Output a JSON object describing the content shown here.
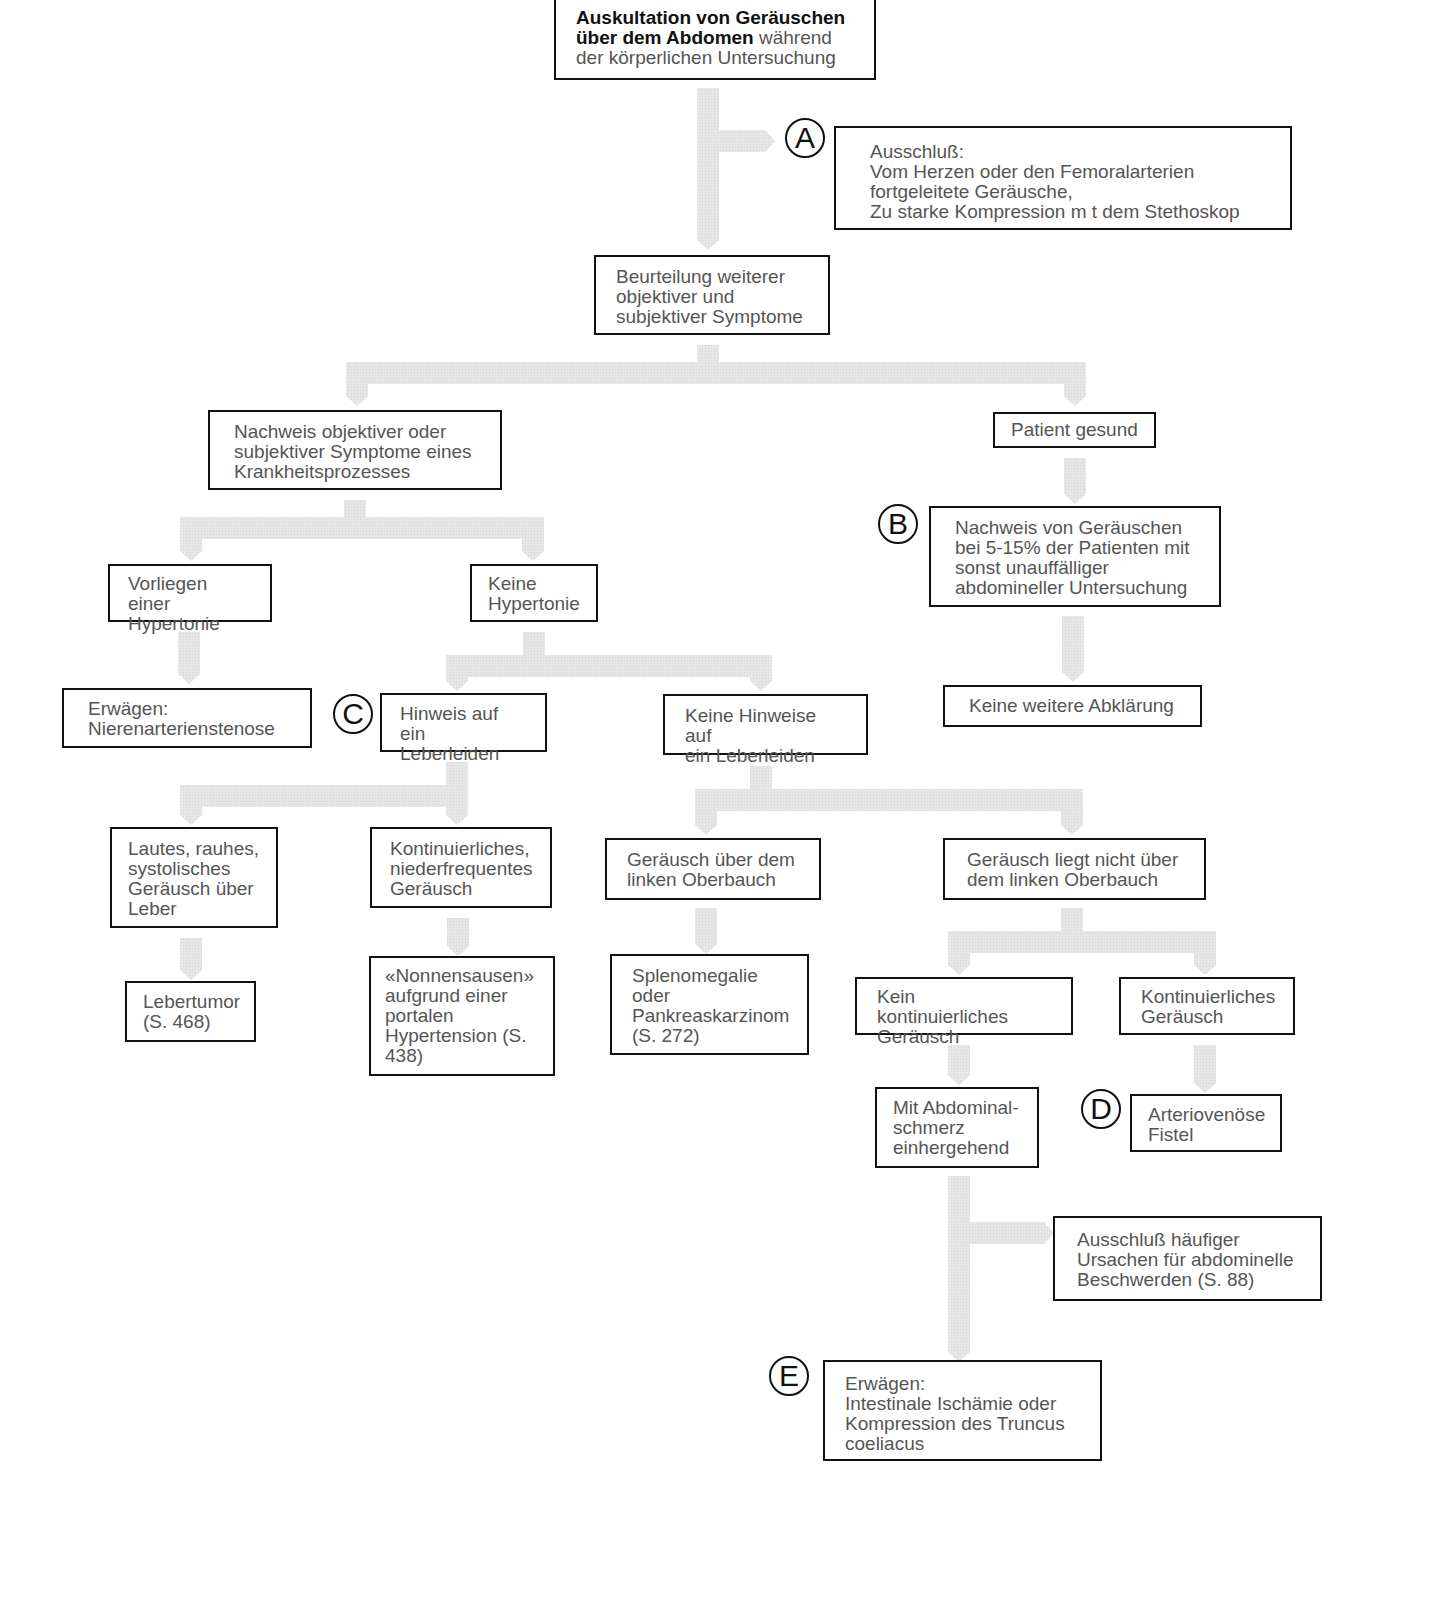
{
  "diagram": {
    "type": "flowchart",
    "language": "de",
    "arrow_color": "#e2e2e2",
    "box_border_color": "#111111",
    "text_color": "#555555",
    "root": {
      "title_bold": "Auskultation von Geräuschen\nüber dem Abdomen",
      "title_rest": " während\nder körperlichen Untersuchung"
    },
    "nodes": {
      "ausschluss_a": "Ausschluß:\n  Vom Herzen oder den Femoralarterien\n     fortgeleitete Geräusche,\n  Zu starke Kompression m t dem Stethoskop",
      "beurteilung": "Beurteilung weiterer\nobjektiver und\nsubjektiver Symptome",
      "nachweis_krankheit": "Nachweis objektiver oder\nsubjektiver Symptome eines\nKrankheitsprozesses",
      "patient_gesund": "Patient gesund",
      "nachweis_geraeusche": "Nachweis von Geräuschen\nbei 5-15% der Patienten mit\nsonst unauffälliger\nabdomineller Untersuchung",
      "keine_abklaerung": "Keine weitere Abklärung",
      "hypertonie": "Vorliegen einer\nHypertonie",
      "keine_hypertonie": "Keine\nHypertonie",
      "nierenarterienstenose": "Erwägen:\n  Nierenarterienstenose",
      "hinweis_leber": "Hinweis auf ein\nLeberleiden",
      "keine_hinweise_leber": "Keine Hinweise auf\nein Leberleiden",
      "lautes_systolisches": "Lautes, rauhes,\nsystolisches\nGeräusch über\nLeber",
      "kontinuierlich_nieder": "Kontinuierliches,\nniederfrequentes\nGeräusch",
      "lebertumor": "Lebertumor\n(S. 468)",
      "nonnensausen": "«Nonnensausen»\n aufgrund einer\nportalen\nHypertension (S.\n438)",
      "ueber_oberbauch": "Geräusch über dem\nlinken Oberbauch",
      "nicht_oberbauch": "Geräusch liegt nicht über\ndem linken Oberbauch",
      "splenomegalie": "Splenomegalie\noder\nPankreaskarzinom\n(S. 272)",
      "kein_kontinuierlich": "Kein kontinuierliches\nGeräusch",
      "kontinuierlich": "Kontinuierliches\nGeräusch",
      "abdominalschmerz": "Mit Abdominal-\nschmerz\neinhergehend",
      "av_fistel": "Arteriovenöse\nFistel",
      "ausschluss_ursachen": "Ausschluß häufiger\nUrsachen für abdominelle\nBeschwerden (S. 88)",
      "ischaemie": "Erwägen:\n  Intestinale Ischämie oder\n  Kompression des Truncus\n     coeliacus"
    },
    "markers": [
      "A",
      "B",
      "C",
      "D",
      "E"
    ]
  }
}
